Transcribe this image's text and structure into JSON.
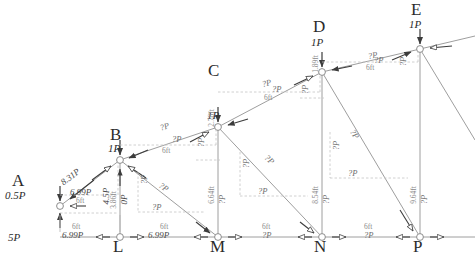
{
  "diagram": {
    "type": "truss-free-body-diagram",
    "title": "",
    "width": 475,
    "height": 260,
    "colors": {
      "member": "#9a9a9a",
      "arrow": "#3c3c3c",
      "dimension": "#9c9c9c",
      "text_dark": "#2b2b2b",
      "text_gray": "#6d6d6d",
      "background": "#ffffff"
    }
  },
  "top_nodes": [
    {
      "name": "A",
      "load": "0.5P",
      "reaction": "5P",
      "x": 60,
      "y": 206
    },
    {
      "name": "B",
      "load": "1P",
      "reaction": "",
      "x": 120,
      "y": 160
    },
    {
      "name": "C",
      "load": "1P",
      "reaction": "",
      "x": 218,
      "y": 127
    },
    {
      "name": "D",
      "load": "1P",
      "reaction": "",
      "x": 322,
      "y": 72
    },
    {
      "name": "E",
      "load": "1P",
      "reaction": "",
      "x": 420,
      "y": 49
    }
  ],
  "bottom_nodes": [
    {
      "name": "L",
      "x": 120,
      "y": 237
    },
    {
      "name": "M",
      "x": 218,
      "y": 237
    },
    {
      "name": "N",
      "x": 322,
      "y": 237
    },
    {
      "name": "P",
      "x": 420,
      "y": 237
    }
  ],
  "top_chord_forces": [
    {
      "label": "8.31P",
      "known": true,
      "x": 62,
      "y": 179,
      "rot": -37
    },
    {
      "label": "?P",
      "known": false,
      "x": 160,
      "y": 124,
      "rot": -19
    },
    {
      "label": "?P",
      "known": false,
      "x": 262,
      "y": 80,
      "rot": -14
    },
    {
      "label": "?P",
      "known": false,
      "x": 368,
      "y": 52,
      "rot": -10
    }
  ],
  "top_chord_components": [
    {
      "h": "6.99P",
      "v": "4.5P",
      "run": "6ft",
      "rise": "3.86ft"
    },
    {
      "h": "?P",
      "v": "?P",
      "run": "6ft",
      "rise": "2.78ft"
    },
    {
      "h": "?P",
      "v": "?P",
      "run": "6ft",
      "rise": "1.89ft"
    },
    {
      "h": "?P",
      "v": "?P",
      "run": "6ft",
      "rise": ""
    }
  ],
  "component_labels": [
    {
      "text": "6.99P",
      "x": 74,
      "y": 190,
      "known": true
    },
    {
      "text": "4.5P",
      "x": 108,
      "y": 176,
      "rot": -90,
      "known": true
    },
    {
      "text": "?P",
      "x": 176,
      "y": 135,
      "known": false
    },
    {
      "text": "?P",
      "x": 203,
      "y": 124,
      "rot": -90,
      "known": false
    },
    {
      "text": "?P",
      "x": 276,
      "y": 88,
      "known": false
    },
    {
      "text": "?P",
      "x": 305,
      "y": 80,
      "rot": -90,
      "known": false
    },
    {
      "text": "?P",
      "x": 378,
      "y": 60,
      "known": false
    },
    {
      "text": "?P",
      "x": 404,
      "y": 55,
      "rot": -90,
      "known": false
    }
  ],
  "vertical_members": [
    {
      "top": "B",
      "bottom": "L",
      "height": "3.86ft",
      "force": "0P",
      "known": true,
      "x": 120
    },
    {
      "top": "C",
      "bottom": "M",
      "height": "6.64ft",
      "force": "?P",
      "known": false,
      "x": 218
    },
    {
      "top": "D",
      "bottom": "N",
      "height": "8.54ft",
      "force": "?P",
      "known": false,
      "x": 322
    },
    {
      "top": "E",
      "bottom": "P",
      "height": "9.64ft",
      "force": "?P",
      "known": false,
      "x": 420
    }
  ],
  "rise_labels": [
    {
      "text": "2.78ft",
      "x": 212,
      "y": 112
    },
    {
      "text": "1.89ft",
      "x": 316,
      "y": 62
    }
  ],
  "diagonal_forces": [
    {
      "label": "?P",
      "x": 158,
      "y": 182,
      "rot": 35
    },
    {
      "label": "?P",
      "x": 198,
      "y": 157,
      "rot": 35
    },
    {
      "label": "?P",
      "x": 272,
      "y": 155,
      "rot": 40
    },
    {
      "label": "?P",
      "x": 352,
      "y": 130,
      "rot": 42
    }
  ],
  "diagonal_components": [
    {
      "h": "?P",
      "v": "?P",
      "hx": 152,
      "hy": 205,
      "vx": 140,
      "vy": 186
    },
    {
      "h": "?P",
      "v": "?P",
      "hx": 255,
      "hy": 190,
      "vx": 240,
      "vy": 168
    },
    {
      "h": "?P",
      "v": "?P",
      "hx": 347,
      "hy": 170,
      "vx": 330,
      "vy": 148
    }
  ],
  "bottom_chord_forces": [
    {
      "label": "6.99P",
      "known": true,
      "x": 74,
      "y": 228
    },
    {
      "label": "6.99P",
      "known": true,
      "x": 158,
      "y": 228
    },
    {
      "label": "?P",
      "known": false,
      "x": 263,
      "y": 228
    },
    {
      "label": "?P",
      "known": false,
      "x": 366,
      "y": 228
    }
  ],
  "bottom_span_labels": [
    {
      "text": "6ft",
      "x": 80,
      "y": 220
    },
    {
      "text": "6ft",
      "x": 166,
      "y": 220
    },
    {
      "text": "6ft",
      "x": 268,
      "y": 220
    },
    {
      "text": "6ft",
      "x": 370,
      "y": 220
    }
  ],
  "panel_width": "6ft",
  "unknown_marker": "?P"
}
